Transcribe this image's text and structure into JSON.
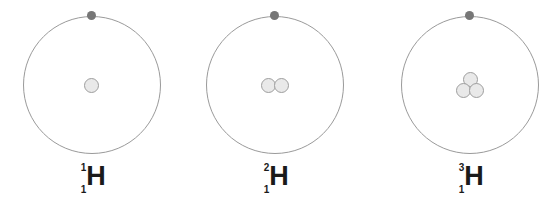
{
  "figure": {
    "background_color": "#ffffff",
    "orbit_color": "#9a9a9a",
    "electron_color": "#777777",
    "nucleus_fill_color": "#e9e9e9",
    "nucleus_border_color": "#9e9e9e",
    "label_color": "#1a1a1a"
  },
  "atoms": [
    {
      "name": "protium",
      "label": {
        "mass_number": "1",
        "atomic_number": "1",
        "symbol": "H"
      },
      "nucleus_particle_count": 1,
      "electron_count": 1
    },
    {
      "name": "deuterium",
      "label": {
        "mass_number": "2",
        "atomic_number": "1",
        "symbol": "H"
      },
      "nucleus_particle_count": 2,
      "electron_count": 1
    },
    {
      "name": "tritium",
      "label": {
        "mass_number": "3",
        "atomic_number": "1",
        "symbol": "H"
      },
      "nucleus_particle_count": 3,
      "electron_count": 1
    }
  ]
}
